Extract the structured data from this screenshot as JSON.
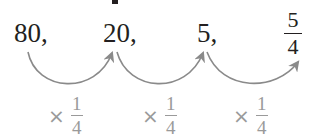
{
  "sequence": {
    "terms": [
      "80,",
      "20,",
      "5,"
    ],
    "last_term": {
      "numerator": "5",
      "denominator": "4"
    }
  },
  "operations": [
    {
      "symbol": "×",
      "numerator": "1",
      "denominator": "4"
    },
    {
      "symbol": "×",
      "numerator": "1",
      "denominator": "4"
    },
    {
      "symbol": "×",
      "numerator": "1",
      "denominator": "4"
    }
  ],
  "colors": {
    "text": "#231f20",
    "arrow": "#8a8a8a",
    "operation_label": "#9a9a9a"
  }
}
